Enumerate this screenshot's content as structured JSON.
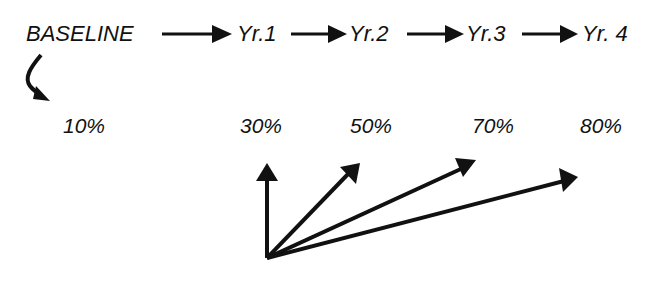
{
  "timeline": {
    "stages": [
      {
        "label": "BASELINE",
        "percent": "10%"
      },
      {
        "label": "Yr.1",
        "percent": "30%"
      },
      {
        "label": "Yr.2",
        "percent": "50%"
      },
      {
        "label": "Yr.3",
        "percent": "70%"
      },
      {
        "label": "Yr. 4",
        "percent": "80%"
      }
    ]
  },
  "vector_fan": {
    "arrow_count": 4,
    "description": "arrows fanning from a common origin, increasingly tilted"
  },
  "colors": {
    "ink": "#111111",
    "background": "#ffffff"
  }
}
